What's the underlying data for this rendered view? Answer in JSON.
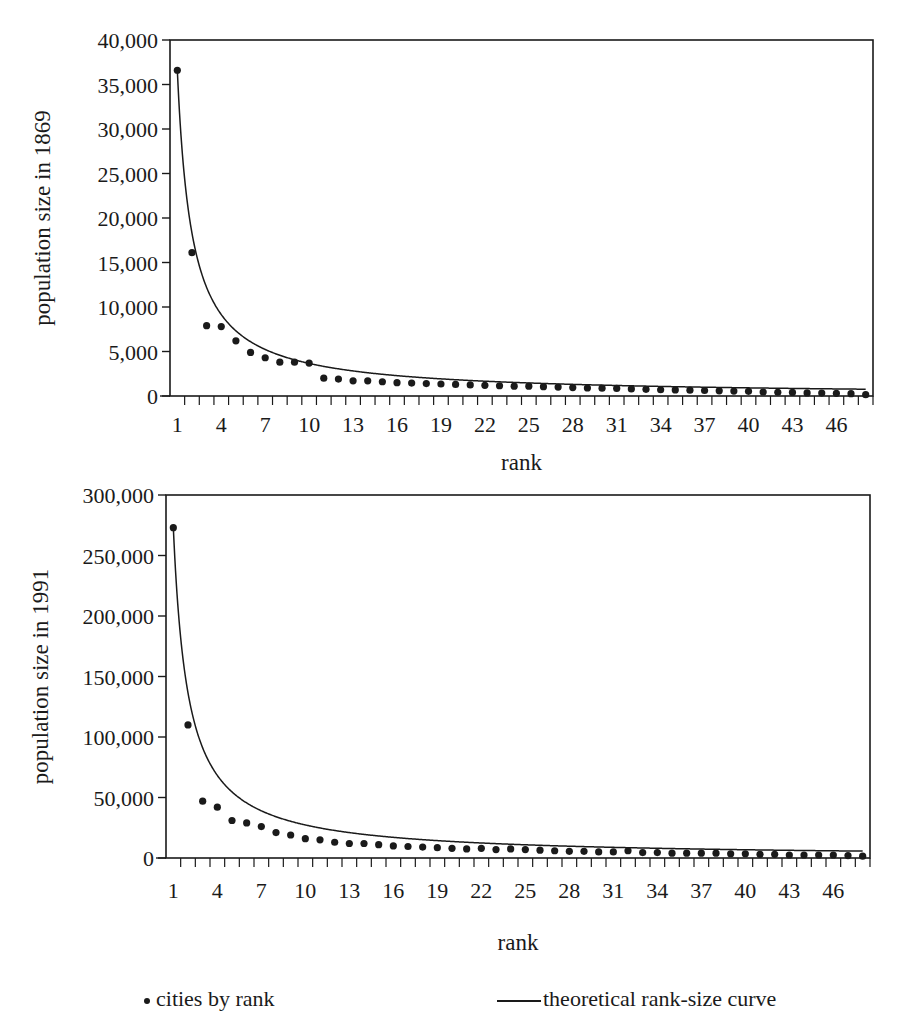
{
  "chart_data": [
    {
      "type": "scatter",
      "title": "",
      "xlabel": "rank",
      "ylabel": "population size in 1869",
      "ylim": [
        0,
        40000
      ],
      "yticks": [
        0,
        5000,
        10000,
        15000,
        20000,
        25000,
        30000,
        35000,
        40000
      ],
      "ytick_labels": [
        "0",
        "5,000",
        "10,000",
        "15,000",
        "20,000",
        "25,000",
        "30,000",
        "35,000",
        "40,000"
      ],
      "xtick_labels": [
        "1",
        "4",
        "7",
        "10",
        "13",
        "16",
        "19",
        "22",
        "25",
        "28",
        "31",
        "34",
        "37",
        "40",
        "43",
        "46"
      ],
      "x_range": [
        1,
        48
      ],
      "grid": false,
      "series": [
        {
          "name": "cities by rank",
          "type": "scatter",
          "x": [
            1,
            2,
            3,
            4,
            5,
            6,
            7,
            8,
            9,
            10,
            11,
            12,
            13,
            14,
            15,
            16,
            17,
            18,
            19,
            20,
            21,
            22,
            23,
            24,
            25,
            26,
            27,
            28,
            29,
            30,
            31,
            32,
            33,
            34,
            35,
            36,
            37,
            38,
            39,
            40,
            41,
            42,
            43,
            44,
            45,
            46,
            47,
            48
          ],
          "values": [
            36600,
            16100,
            7900,
            7800,
            6200,
            4900,
            4300,
            3800,
            3800,
            3700,
            2000,
            1900,
            1700,
            1700,
            1600,
            1500,
            1450,
            1400,
            1350,
            1300,
            1250,
            1200,
            1150,
            1100,
            1100,
            1050,
            1000,
            950,
            900,
            880,
            850,
            800,
            750,
            700,
            680,
            650,
            620,
            580,
            550,
            520,
            450,
            420,
            400,
            350,
            330,
            300,
            260,
            150
          ]
        },
        {
          "name": "theoretical rank-size curve",
          "type": "line",
          "formula": "36600 / rank"
        }
      ]
    },
    {
      "type": "scatter",
      "title": "",
      "xlabel": "rank",
      "ylabel": "population size in 1991",
      "ylim": [
        0,
        300000
      ],
      "yticks": [
        0,
        50000,
        100000,
        150000,
        200000,
        250000,
        300000
      ],
      "ytick_labels": [
        "0",
        "50,000",
        "100,000",
        "150,000",
        "200,000",
        "250,000",
        "300,000"
      ],
      "xtick_labels": [
        "1",
        "4",
        "7",
        "10",
        "13",
        "16",
        "19",
        "22",
        "25",
        "28",
        "31",
        "34",
        "37",
        "40",
        "43",
        "46"
      ],
      "x_range": [
        1,
        48
      ],
      "grid": false,
      "series": [
        {
          "name": "cities by rank",
          "type": "scatter",
          "x": [
            1,
            2,
            3,
            4,
            5,
            6,
            7,
            8,
            9,
            10,
            11,
            12,
            13,
            14,
            15,
            16,
            17,
            18,
            19,
            20,
            21,
            22,
            23,
            24,
            25,
            26,
            27,
            28,
            29,
            30,
            31,
            32,
            33,
            34,
            35,
            36,
            37,
            38,
            39,
            40,
            41,
            42,
            43,
            44,
            45,
            46,
            47,
            48
          ],
          "values": [
            273000,
            110000,
            47000,
            42000,
            31000,
            29000,
            26000,
            21000,
            19000,
            16000,
            15000,
            13000,
            12000,
            12000,
            11000,
            10000,
            9500,
            9000,
            8500,
            8000,
            7500,
            8000,
            7000,
            7500,
            7000,
            6500,
            6000,
            5500,
            5500,
            5000,
            5000,
            6000,
            4500,
            4500,
            4000,
            4000,
            4000,
            4000,
            3500,
            3500,
            3000,
            3000,
            2500,
            2500,
            2500,
            2500,
            2000,
            1500
          ]
        },
        {
          "name": "theoretical rank-size curve",
          "type": "line",
          "formula": "273000 / rank"
        }
      ]
    }
  ],
  "legend": {
    "dots_label": "cities by rank",
    "line_label": "theoretical rank-size curve"
  },
  "colors": {
    "ink": "#1a1a1a",
    "background": "#ffffff"
  },
  "layout": {
    "charts": [
      {
        "left": 170,
        "right": 873,
        "top": 40,
        "bottom": 396,
        "ylabel_x": 50,
        "xlabel_y": 470,
        "ticklabel_y": 432
      },
      {
        "left": 166,
        "right": 870,
        "top": 495,
        "bottom": 858,
        "ylabel_x": 48,
        "xlabel_y": 950,
        "ticklabel_y": 898
      }
    ]
  }
}
